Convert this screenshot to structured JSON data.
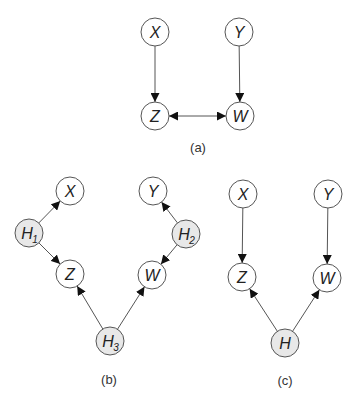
{
  "figure": {
    "node_radius": 14,
    "colors": {
      "observed_fill": "#ffffff",
      "latent_fill": "#e8e8e8",
      "stroke": "#555555",
      "text": "#222222"
    },
    "panels": [
      {
        "id": "a",
        "caption": "(a)",
        "caption_pos": [
          198,
          152
        ],
        "nodes": [
          {
            "id": "X",
            "label": "X",
            "sub": "",
            "x": 155,
            "y": 32,
            "latent": false
          },
          {
            "id": "Y",
            "label": "Y",
            "sub": "",
            "x": 239,
            "y": 32,
            "latent": false
          },
          {
            "id": "Z",
            "label": "Z",
            "sub": "",
            "x": 155,
            "y": 116,
            "latent": false
          },
          {
            "id": "W",
            "label": "W",
            "sub": "",
            "x": 240,
            "y": 116,
            "latent": false
          }
        ],
        "edges": [
          {
            "from": "X",
            "to": "Z",
            "type": "directed"
          },
          {
            "from": "Y",
            "to": "W",
            "type": "directed"
          },
          {
            "from": "Z",
            "to": "W",
            "type": "bidirected"
          }
        ]
      },
      {
        "id": "b",
        "caption": "(b)",
        "caption_pos": [
          109,
          384
        ],
        "nodes": [
          {
            "id": "X",
            "label": "X",
            "sub": "",
            "x": 70,
            "y": 191,
            "latent": false
          },
          {
            "id": "Y",
            "label": "Y",
            "sub": "",
            "x": 153,
            "y": 191,
            "latent": false
          },
          {
            "id": "H1",
            "label": "H",
            "sub": "1",
            "x": 29,
            "y": 233,
            "latent": true
          },
          {
            "id": "H2",
            "label": "H",
            "sub": "2",
            "x": 186,
            "y": 234,
            "latent": true
          },
          {
            "id": "Z",
            "label": "Z",
            "sub": "",
            "x": 70,
            "y": 274,
            "latent": false
          },
          {
            "id": "W",
            "label": "W",
            "sub": "",
            "x": 152,
            "y": 275,
            "latent": false
          },
          {
            "id": "H3",
            "label": "H",
            "sub": "3",
            "x": 110,
            "y": 341,
            "latent": true
          }
        ],
        "edges": [
          {
            "from": "H1",
            "to": "X",
            "type": "directed"
          },
          {
            "from": "H1",
            "to": "Z",
            "type": "directed"
          },
          {
            "from": "H2",
            "to": "Y",
            "type": "directed"
          },
          {
            "from": "H2",
            "to": "W",
            "type": "directed"
          },
          {
            "from": "H3",
            "to": "Z",
            "type": "directed"
          },
          {
            "from": "H3",
            "to": "W",
            "type": "directed"
          }
        ]
      },
      {
        "id": "c",
        "caption": "(c)",
        "caption_pos": [
          285,
          385
        ],
        "nodes": [
          {
            "id": "X",
            "label": "X",
            "sub": "",
            "x": 243,
            "y": 194,
            "latent": false
          },
          {
            "id": "Y",
            "label": "Y",
            "sub": "",
            "x": 328,
            "y": 194,
            "latent": false
          },
          {
            "id": "Z",
            "label": "Z",
            "sub": "",
            "x": 242,
            "y": 277,
            "latent": false
          },
          {
            "id": "W",
            "label": "W",
            "sub": "",
            "x": 327,
            "y": 278,
            "latent": false
          },
          {
            "id": "H",
            "label": "H",
            "sub": "",
            "x": 285,
            "y": 343,
            "latent": true
          }
        ],
        "edges": [
          {
            "from": "X",
            "to": "Z",
            "type": "directed"
          },
          {
            "from": "Y",
            "to": "W",
            "type": "directed"
          },
          {
            "from": "H",
            "to": "Z",
            "type": "directed"
          },
          {
            "from": "H",
            "to": "W",
            "type": "directed"
          }
        ]
      }
    ]
  }
}
